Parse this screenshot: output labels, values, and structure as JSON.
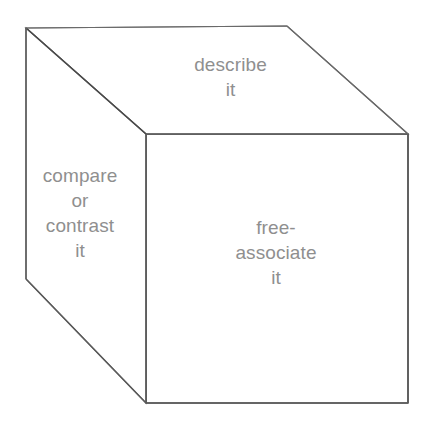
{
  "figure": {
    "name": "thinking-cube-diagram",
    "shape": "cube",
    "background_color": "#ffffff",
    "line_color": "#606060",
    "text_color": "#8f8f8f",
    "faces": {
      "top": {
        "label": "describe\nit",
        "lines": [
          "describe",
          "it"
        ]
      },
      "left": {
        "label": "compare\nor\ncontrast\nit",
        "lines": [
          "compare",
          "or",
          "contrast",
          "it"
        ]
      },
      "front": {
        "label": "free-\nassociate\nit",
        "lines": [
          "free-",
          "associate",
          "it"
        ]
      }
    },
    "geometry": {
      "back_top_left": [
        26,
        28
      ],
      "back_top_right": [
        287,
        26
      ],
      "front_top_left": [
        146,
        134
      ],
      "front_top_right": [
        408,
        134
      ],
      "back_bottom_left": [
        26,
        279
      ],
      "front_bottom_left": [
        146,
        403
      ],
      "front_bottom_right": [
        408,
        403
      ]
    }
  }
}
